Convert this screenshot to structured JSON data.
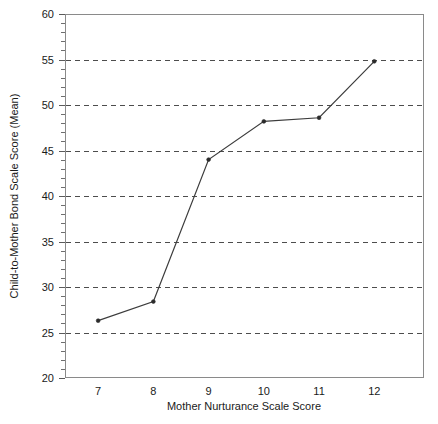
{
  "chart_data": {
    "type": "line",
    "title": "",
    "subtitle": "",
    "xlabel": "Mother Nurturance Scale Score",
    "ylabel": "Child-to-Mother Bond Scale Score (Mean)",
    "x": [
      7,
      8,
      9,
      10,
      11,
      12
    ],
    "values": [
      26.3,
      28.4,
      44.0,
      48.2,
      48.6,
      54.8
    ],
    "series": [
      {
        "name": "Child-to-Mother Bond Scale Score (Mean)",
        "values": [
          26.3,
          28.4,
          44.0,
          48.2,
          48.6,
          54.8
        ]
      }
    ],
    "xlim": [
      6.4,
      12.9
    ],
    "ylim": [
      20,
      60
    ],
    "xticks": [
      7,
      8,
      9,
      10,
      11,
      12
    ],
    "xtick_labels": [
      "7",
      "8",
      "9",
      "10",
      "11",
      "12"
    ],
    "yticks": [
      20,
      25,
      30,
      35,
      40,
      45,
      50,
      55,
      60
    ],
    "ytick_labels": [
      "20",
      "25",
      "30",
      "35",
      "40",
      "45",
      "50",
      "55",
      "60"
    ],
    "y_minor_tick_step": 1,
    "grid": {
      "x": false,
      "y": true,
      "style": "dashed",
      "drawn_at": [
        25,
        30,
        35,
        40,
        45,
        50,
        55
      ]
    },
    "legend": {
      "visible": false,
      "position": "none",
      "entries": []
    },
    "annotations": [],
    "marker": "dot",
    "colors": {
      "line": "#3c3c3c",
      "marker": "#2b2b2b",
      "grid": "#4d4d4d",
      "frame": "#8a8a8a",
      "text": "#1a1a1a",
      "background": "#ffffff"
    }
  },
  "figure": {
    "background_color": "#ffffff",
    "plot_area": {
      "left": 65,
      "top": 14,
      "right": 424,
      "bottom": 378
    }
  }
}
